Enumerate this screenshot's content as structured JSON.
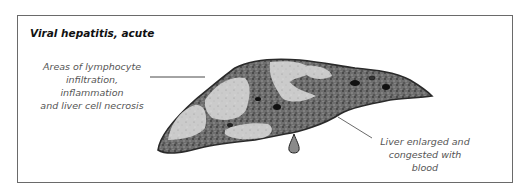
{
  "figure": {
    "title": "Viral hepatitis, acute",
    "annotations": [
      {
        "id": "necrosis",
        "lines": [
          "Areas of lymphocyte",
          "infiltration, inflammation",
          "and liver cell necrosis"
        ]
      },
      {
        "id": "enlarged",
        "lines": [
          "Liver enlarged and",
          "congested with blood"
        ]
      }
    ],
    "colors": {
      "frame": "#6a6a6a",
      "liver_tissue": "#6e6e6e",
      "necrotic_areas": "#c8c8c8",
      "outline": "#2a2a2a",
      "label_text": "#555555"
    }
  }
}
